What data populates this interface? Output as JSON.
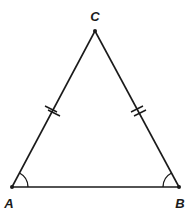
{
  "diagram": {
    "type": "isosceles-triangle",
    "colors": {
      "stroke": "#1a1a1a",
      "background": "#ffffff"
    },
    "vertices": [
      {
        "id": "A",
        "label": "A",
        "x": 12,
        "y": 187,
        "label_x": 9,
        "label_y": 208
      },
      {
        "id": "B",
        "label": "B",
        "x": 179,
        "y": 187,
        "label_x": 180,
        "label_y": 208
      },
      {
        "id": "C",
        "label": "C",
        "x": 95,
        "y": 31,
        "label_x": 95,
        "label_y": 21
      }
    ],
    "sides": [
      {
        "from": "A",
        "to": "B",
        "tick_marks": 0
      },
      {
        "from": "A",
        "to": "C",
        "tick_marks": 2
      },
      {
        "from": "B",
        "to": "C",
        "tick_marks": 2
      }
    ],
    "angle_marks": [
      {
        "vertex": "A",
        "arcs": 1
      },
      {
        "vertex": "B",
        "arcs": 1
      }
    ]
  }
}
